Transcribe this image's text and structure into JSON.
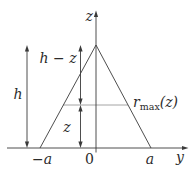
{
  "diagram": {
    "labels": {
      "z_axis": "z",
      "y_axis": "y",
      "total_height": "h",
      "upper_segment": "h − z",
      "lower_segment": "z",
      "r_max_base": "r",
      "r_max_sub": "max",
      "r_max_arg": "(z)",
      "base_left": "−a",
      "origin": "0",
      "base_right": "a"
    },
    "colors": {
      "line": "#3a3a3a",
      "chord": "#9a9a9a",
      "text": "#2b2b2b",
      "background": "#ffffff"
    }
  }
}
